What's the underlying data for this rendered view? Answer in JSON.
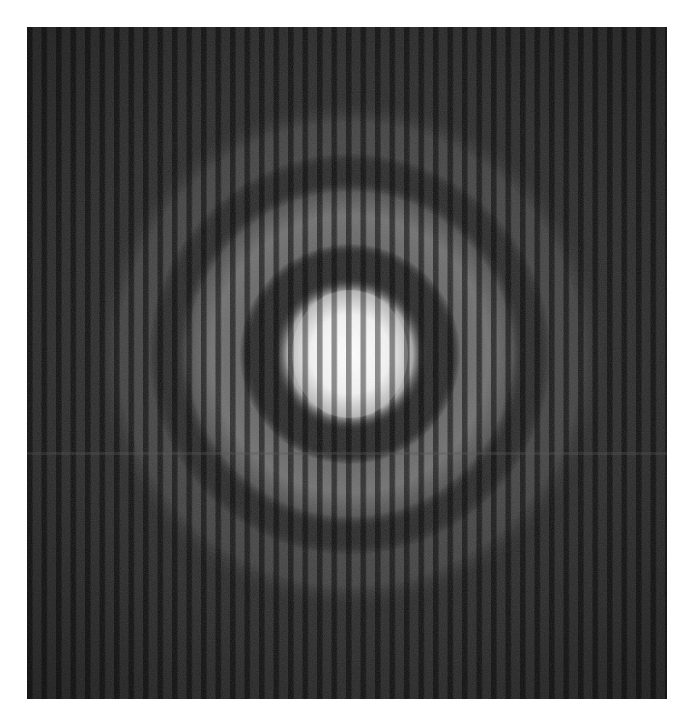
{
  "image": {
    "kind": "interference-pattern",
    "description": "Concentric circular rings modulated by vertical straight fringes, grayscale",
    "background_color": "#ffffff",
    "frame": {
      "x": 27,
      "y": 27,
      "width": 640,
      "height": 672
    },
    "base_color": "#2e2e2e",
    "center": {
      "x": 350,
      "y": 354
    },
    "rings": [
      {
        "name": "central-spot",
        "inner_radius": 0,
        "outer_radius": 68,
        "brightness": 1.0
      },
      {
        "name": "ring-2",
        "inner_radius": 108,
        "outer_radius": 165,
        "brightness": 0.45
      },
      {
        "name": "ring-3",
        "inner_radius": 190,
        "outer_radius": 258,
        "brightness": 0.22
      }
    ],
    "fringes": {
      "orientation": "vertical",
      "period_px": 14.5
    },
    "artifacts": [
      {
        "type": "horizontal-line",
        "y": 453
      }
    ]
  }
}
